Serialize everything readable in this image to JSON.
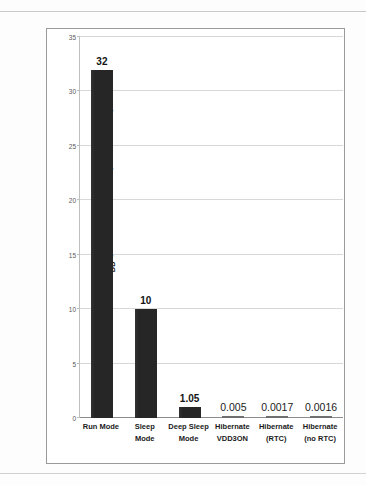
{
  "chart_data": {
    "type": "bar",
    "title": "",
    "subtitle": "",
    "xlabel": "",
    "ylabel": "IDD (Current Consumption in mA)",
    "ylabel_main": "I",
    "ylabel_sub": "DD",
    "ylabel_rest": " (Current Consumption  in mA)",
    "ylim": [
      0,
      35
    ],
    "yticks": [
      0,
      5,
      10,
      15,
      20,
      25,
      30,
      35
    ],
    "ytick_labels": [
      "0",
      "5",
      "10",
      "15",
      "20",
      "25",
      "30",
      "35"
    ],
    "grid": true,
    "grid_axis": "y",
    "legend": false,
    "legend_position": "none",
    "bar_color": "#262626",
    "small_bar_color": "#6f6f6f",
    "categories": [
      "Run Mode",
      "Sleep Mode",
      "Deep Sleep Mode",
      "Hibernate VDD3ON",
      "Hibernate (RTC)",
      "Hibernate (no RTC)"
    ],
    "category_lines": [
      [
        "Run Mode"
      ],
      [
        "Sleep",
        "Mode"
      ],
      [
        "Deep Sleep",
        "Mode"
      ],
      [
        "Hibernate",
        "VDD3ON"
      ],
      [
        "Hibernate",
        "(RTC)"
      ],
      [
        "Hibernate",
        "(no RTC)"
      ]
    ],
    "values": [
      32,
      10,
      1.05,
      0.005,
      0.0017,
      0.0016
    ],
    "value_labels": [
      "32",
      "10",
      "1.05",
      "0.005",
      "0.0017",
      "0.0016"
    ]
  }
}
